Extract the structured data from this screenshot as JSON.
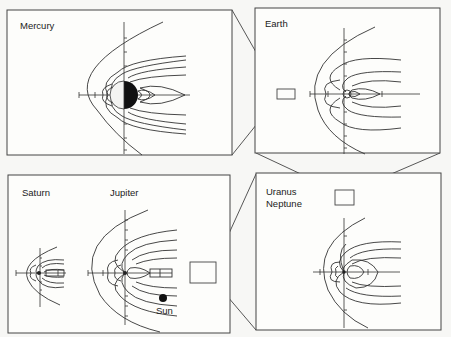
{
  "panels": {
    "mercury": {
      "label": "Mercury"
    },
    "earth": {
      "label": "Earth"
    },
    "saturn": {
      "label": "Saturn"
    },
    "jupiter": {
      "label": "Jupiter",
      "sun_label": "Sun"
    },
    "uranus_neptune": {
      "label_line1": "Uranus",
      "label_line2": "Neptune"
    }
  },
  "colors": {
    "line": "#333333",
    "frame": "#444444",
    "background": "#fdfdfb",
    "planet_dark": "#111111"
  }
}
